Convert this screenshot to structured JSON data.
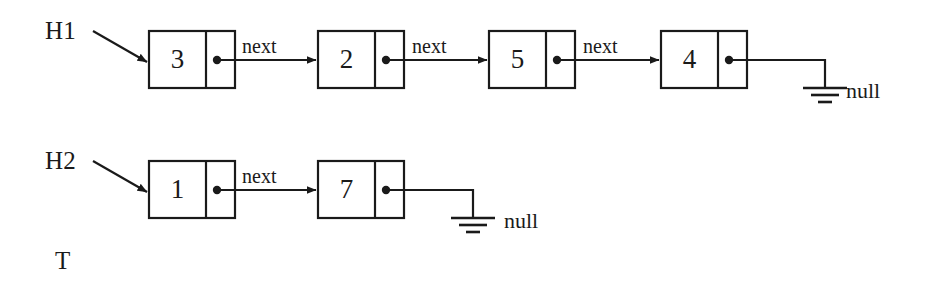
{
  "diagram": {
    "background_color": "#ffffff",
    "stroke_color": "#1a1a1a",
    "lists": [
      {
        "id": "list-1",
        "head_label": "H1",
        "nodes": [
          {
            "value": "3",
            "next_label": "next"
          },
          {
            "value": "2",
            "next_label": "next"
          },
          {
            "value": "5",
            "next_label": "next"
          },
          {
            "value": "4",
            "next_label": ""
          }
        ],
        "terminator_label": "null"
      },
      {
        "id": "list-2",
        "head_label": "H2",
        "nodes": [
          {
            "value": "1",
            "next_label": "next"
          },
          {
            "value": "7",
            "next_label": ""
          }
        ],
        "terminator_label": "null"
      }
    ],
    "tail_label": "T"
  },
  "labels": {
    "h1": "H1",
    "h2": "H2",
    "t": "T",
    "next": "next",
    "null": "null",
    "row1_node1": "3",
    "row1_node2": "2",
    "row1_node3": "5",
    "row1_node4": "4",
    "row2_node1": "1",
    "row2_node2": "7",
    "row1_next1": "next",
    "row1_next2": "next",
    "row1_next3": "next",
    "row2_next1": "next",
    "row1_null": "null",
    "row2_null": "null"
  }
}
